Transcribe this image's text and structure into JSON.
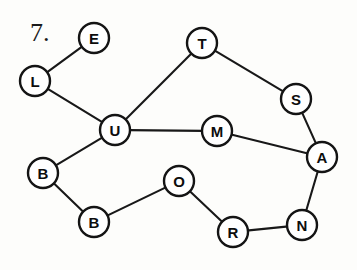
{
  "figure": {
    "problem_number": "7.",
    "type": "undirected-graph-diagram",
    "background_color": "#fdfdfb",
    "stroke_color": "#141414",
    "node_fill_color": "#ffffff",
    "canvas": {
      "width": 357,
      "height": 270
    }
  },
  "nodes": [
    {
      "id": "E",
      "label": "E",
      "x": 94,
      "y": 38,
      "r": 15
    },
    {
      "id": "L",
      "label": "L",
      "x": 35,
      "y": 81,
      "r": 15
    },
    {
      "id": "T",
      "label": "T",
      "x": 202,
      "y": 43,
      "r": 15
    },
    {
      "id": "S",
      "label": "S",
      "x": 296,
      "y": 99,
      "r": 15
    },
    {
      "id": "U",
      "label": "U",
      "x": 115,
      "y": 130,
      "r": 15
    },
    {
      "id": "M",
      "label": "M",
      "x": 217,
      "y": 131,
      "r": 15
    },
    {
      "id": "A",
      "label": "A",
      "x": 322,
      "y": 157,
      "r": 15
    },
    {
      "id": "B1",
      "label": "B",
      "x": 43,
      "y": 173,
      "r": 15
    },
    {
      "id": "O",
      "label": "O",
      "x": 179,
      "y": 181,
      "r": 15
    },
    {
      "id": "B2",
      "label": "B",
      "x": 94,
      "y": 222,
      "r": 15
    },
    {
      "id": "R",
      "label": "R",
      "x": 233,
      "y": 232,
      "r": 15
    },
    {
      "id": "N",
      "label": "N",
      "x": 302,
      "y": 225,
      "r": 15
    }
  ],
  "edges": [
    {
      "from": "L",
      "to": "E"
    },
    {
      "from": "L",
      "to": "U"
    },
    {
      "from": "U",
      "to": "T"
    },
    {
      "from": "T",
      "to": "S"
    },
    {
      "from": "S",
      "to": "A"
    },
    {
      "from": "U",
      "to": "M"
    },
    {
      "from": "M",
      "to": "A"
    },
    {
      "from": "U",
      "to": "B1"
    },
    {
      "from": "B1",
      "to": "B2"
    },
    {
      "from": "B2",
      "to": "O"
    },
    {
      "from": "O",
      "to": "R"
    },
    {
      "from": "R",
      "to": "N"
    },
    {
      "from": "N",
      "to": "A"
    }
  ],
  "problem_label": {
    "text": "7.",
    "x": 30,
    "y": 41
  }
}
